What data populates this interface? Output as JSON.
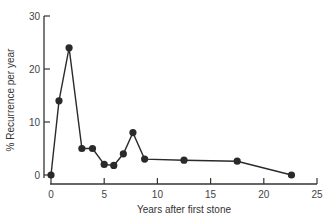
{
  "chart_data": {
    "type": "line",
    "title": "",
    "xlabel": "Years after first stone",
    "ylabel": "% Recurrence per year",
    "xlim": [
      0,
      25
    ],
    "ylim": [
      0,
      30
    ],
    "xticks": [
      0,
      5,
      10,
      15,
      20,
      25
    ],
    "yticks": [
      0,
      10,
      20,
      30
    ],
    "grid": false,
    "legend": null,
    "series": [
      {
        "name": "Recurrence",
        "x": [
          0,
          0.75,
          1.7,
          2.9,
          3.9,
          5.0,
          5.9,
          6.8,
          7.7,
          8.8,
          12.5,
          17.5,
          22.6
        ],
        "y": [
          0,
          14,
          24,
          5,
          5,
          2,
          1.8,
          4,
          8,
          3,
          2.8,
          2.6,
          0
        ]
      }
    ],
    "colors": {
      "line": "#2a2a2a",
      "marker": "#2a2a2a",
      "axis": "#333333"
    }
  }
}
